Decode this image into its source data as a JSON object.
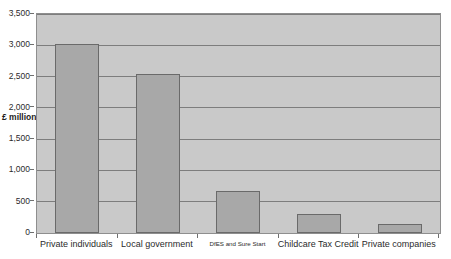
{
  "chart_data": {
    "type": "bar",
    "title": "",
    "xlabel": "",
    "ylabel": "£ million",
    "ylim": [
      0,
      3500
    ],
    "ytick_step": 500,
    "grid": true,
    "legend": "none",
    "categories": [
      "Private individuals",
      "Local government",
      "DfES and Sure Start",
      "Childcare Tax Credit",
      "Private companies"
    ],
    "values": [
      3016,
      2540,
      670,
      310,
      145
    ],
    "ytick_labels": [
      "0",
      "500",
      "1,000",
      "1,500",
      "2,000",
      "2,500",
      "3,000",
      "3,500"
    ],
    "ytick_values": [
      0,
      500,
      1000,
      1500,
      2000,
      2500,
      3000,
      3500
    ],
    "colors": {
      "bar_fill": "#a8a8a8",
      "bar_border": "#6a6a6a",
      "plot_background": "#c9c9c9",
      "gridline": "#7d7d7d",
      "page_background": "#ffffff",
      "text": "#2b2b2b"
    },
    "label_styles": {
      "small_label_index": 2
    }
  }
}
